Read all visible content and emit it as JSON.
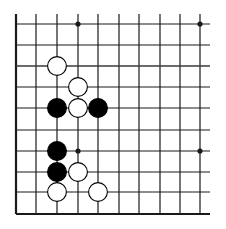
{
  "board": {
    "title": "Go board position (bottom-left corner fragment)",
    "line_color": "#1a1a1a",
    "background": "#ffffff",
    "columns_x": [
      16,
      36,
      57,
      78,
      98,
      119,
      139,
      160,
      180,
      200
    ],
    "rows_y": [
      24,
      45,
      66,
      87,
      108,
      130,
      151,
      172,
      192,
      214
    ],
    "top_y": 14,
    "right_x": 210,
    "left_edge": true,
    "bottom_edge": true,
    "highlight_row_index": 2,
    "star_points": [
      {
        "col": 3,
        "row": 0
      },
      {
        "col": 9,
        "row": 0
      },
      {
        "col": 3,
        "row": 6
      },
      {
        "col": 9,
        "row": 6
      }
    ],
    "stones": [
      {
        "color": "white",
        "col": 2,
        "row": 2
      },
      {
        "color": "white",
        "col": 3,
        "row": 3
      },
      {
        "color": "black",
        "col": 2,
        "row": 4
      },
      {
        "color": "white",
        "col": 3,
        "row": 4
      },
      {
        "color": "black",
        "col": 4,
        "row": 4
      },
      {
        "color": "black",
        "col": 2,
        "row": 6
      },
      {
        "color": "black",
        "col": 2,
        "row": 7
      },
      {
        "color": "white",
        "col": 3,
        "row": 7
      },
      {
        "color": "white",
        "col": 2,
        "row": 8
      },
      {
        "color": "white",
        "col": 4,
        "row": 8
      }
    ],
    "stone_colors": {
      "black": "#000000",
      "white": "#ffffff",
      "outline": "#000000"
    }
  }
}
